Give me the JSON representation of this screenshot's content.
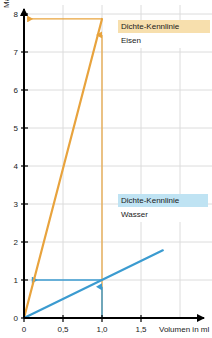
{
  "chart_data": {
    "type": "line",
    "title": "",
    "xlabel": "Volumen in ml",
    "ylabel": "Masse in g",
    "xlim": [
      0,
      1.78
    ],
    "ylim": [
      0,
      8.2
    ],
    "xticks": [
      0,
      0.5,
      1.0,
      1.5
    ],
    "xticklabels": [
      "0",
      "0,5",
      "1,0",
      "1,5"
    ],
    "yticks": [
      0,
      1,
      2,
      3,
      4,
      5,
      6,
      7,
      8
    ],
    "yticklabels": [
      "0",
      "1",
      "2",
      "3",
      "4",
      "5",
      "6",
      "7",
      "8"
    ],
    "grid": true,
    "legend_position": "inside",
    "series": [
      {
        "name": "Eisen",
        "legend_title": "Dichte-Kennlinie",
        "color": "#e8a33d",
        "slope": 7.87,
        "x": [
          0,
          1.0
        ],
        "y": [
          0,
          7.87
        ]
      },
      {
        "name": "Wasser",
        "legend_title": "Dichte-Kennlinie",
        "color": "#3b9bd0",
        "slope": 1.0,
        "x": [
          0,
          1.78
        ],
        "y": [
          0,
          1.78
        ]
      }
    ],
    "annotations": [
      {
        "name": "eisen-vertical-arrow",
        "color": "#e8a33d",
        "from": [
          1.0,
          0
        ],
        "to": [
          1.0,
          7.45
        ],
        "direction": "up"
      },
      {
        "name": "eisen-horizontal-arrow",
        "color": "#e8a33d",
        "from": [
          1.0,
          7.87
        ],
        "to": [
          0.04,
          7.87
        ],
        "direction": "left"
      },
      {
        "name": "wasser-vertical-arrow",
        "color": "#3b9bd0",
        "from": [
          1.0,
          0
        ],
        "to": [
          1.0,
          0.82
        ],
        "direction": "up"
      },
      {
        "name": "wasser-horizontal-arrow",
        "color": "#3b9bd0",
        "from": [
          1.0,
          1.0
        ],
        "to": [
          0.1,
          1.0
        ],
        "direction": "left"
      }
    ]
  },
  "legends": {
    "eisen": {
      "title": "Dichte-Kennlinie",
      "subtitle": "Eisen"
    },
    "wasser": {
      "title": "Dichte-Kennlinie",
      "subtitle": "Wasser"
    }
  },
  "axes": {
    "x_title": "Volumen in ml",
    "y_title": "Masse in g"
  },
  "colors": {
    "eisen": "#e8a33d",
    "wasser": "#3b9bd0",
    "eisen_legend_bg": "#f7dfad",
    "wasser_legend_bg": "#bfe3f3",
    "grid": "#dcdcdc",
    "axis": "#000000"
  }
}
